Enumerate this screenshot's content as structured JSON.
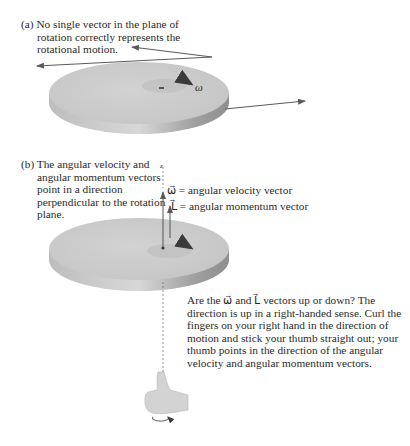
{
  "panel_a": {
    "label": "(a)",
    "caption": "No single vector in the plane of rotation correctly represents the rotational motion.",
    "omega_symbol": "ω"
  },
  "panel_b": {
    "label": "(b)",
    "caption": "The angular velocity and angular momentum vectors point in a direction perpendicular to the rotation plane.",
    "axis_label": "z",
    "omega_vector_label": "ω⃗ = angular velocity vector",
    "L_vector_label": "L⃗ = angular momentum vector",
    "description": "Are the ω⃗ and L⃗ vectors up or down? The direction is up in a right-handed sense. Curl the fingers on your right hand in the direction of motion and stick your thumb straight out; your thumb points in the direction of the angular velocity and angular momentum vectors."
  },
  "colors": {
    "disk_top": "#c9c9c9",
    "disk_edge": "#a8a8a8",
    "arrow": "#5a5a5a",
    "text": "#2a2a2a"
  }
}
